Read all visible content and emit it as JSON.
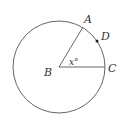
{
  "diagram": {
    "type": "circle-central-angle",
    "stroke_color": "#666666",
    "label_color": "#333333",
    "circle": {
      "center": "B",
      "cx": 59,
      "cy": 67,
      "r": 46
    },
    "points": [
      {
        "name": "A",
        "label": "A",
        "x": 83,
        "y": 27,
        "label_x": 84,
        "label_y": 23
      },
      {
        "name": "B",
        "label": "B",
        "x": 59,
        "y": 67,
        "label_x": 44,
        "label_y": 76
      },
      {
        "name": "C",
        "label": "C",
        "x": 105,
        "y": 67,
        "label_x": 108,
        "label_y": 72
      },
      {
        "name": "D",
        "label": "D",
        "x": 97,
        "y": 41,
        "label_x": 101,
        "label_y": 40
      }
    ],
    "segments": [
      "BA",
      "BC"
    ],
    "angle_label": {
      "text": "x°",
      "vertex": "B",
      "x": 69,
      "y": 65
    }
  }
}
